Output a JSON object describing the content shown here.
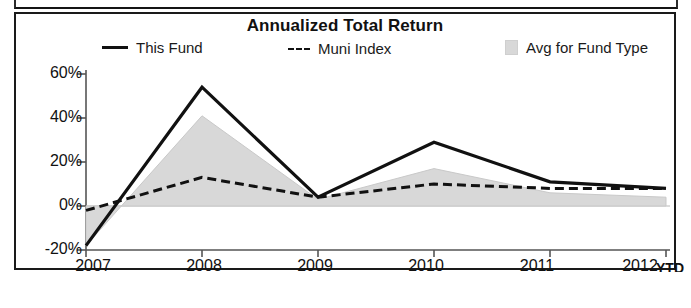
{
  "chart_data": {
    "type": "line",
    "title": "Annualized Total Return",
    "xlabel": "",
    "ylabel": "",
    "x": [
      "2007",
      "2008",
      "2009",
      "2010",
      "2011",
      "2012"
    ],
    "categories": [
      "2007",
      "2008",
      "2009",
      "2010",
      "2011",
      "2012"
    ],
    "x_axis_suffix": "YTD",
    "ylim": [
      -20,
      60
    ],
    "yticks": [
      -20,
      0,
      20,
      40,
      60
    ],
    "ytick_labels": [
      "-20%",
      "0%",
      "20%",
      "40%",
      "60%"
    ],
    "grid": false,
    "legend_position": "top",
    "series": [
      {
        "name": "This Fund",
        "style": "solid-line",
        "color": "#111111",
        "values": [
          -18,
          54,
          4,
          29,
          11,
          8
        ]
      },
      {
        "name": "Muni Index",
        "style": "dashed-line",
        "color": "#111111",
        "values": [
          -2,
          13,
          4,
          10,
          8,
          8
        ]
      },
      {
        "name": "Avg for Fund Type",
        "style": "shaded-area",
        "color": "#d8d8d8",
        "values": [
          -18,
          41,
          3,
          17,
          6,
          4
        ]
      }
    ]
  },
  "chart": {
    "title": "Annualized Total Return",
    "legend": [
      {
        "label": "This Fund",
        "marker": "solid-line-swatch"
      },
      {
        "label": "Muni Index",
        "marker": "dashed-line-swatch"
      },
      {
        "label": "Avg for Fund Type",
        "marker": "filled-square-swatch"
      }
    ],
    "y_axis": {
      "labels": [
        "60%",
        "40%",
        "20%",
        "0%",
        "-20%"
      ]
    },
    "x_axis": {
      "labels": [
        "2007",
        "2008",
        "2009",
        "2010",
        "2011",
        "2012"
      ],
      "ytd_label": "YTD"
    }
  },
  "colors": {
    "line": "#111111",
    "area_fill": "#d8d8d8",
    "axis": "#555555",
    "panel_border": "#1a1a1a",
    "background": "#ffffff"
  }
}
